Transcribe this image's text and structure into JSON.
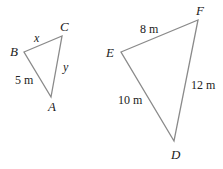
{
  "diagram": {
    "type": "similar-triangles",
    "triangles": [
      {
        "name": "triangle-ABC",
        "vertices": {
          "A": {
            "label": "A",
            "x": 51,
            "y": 97
          },
          "B": {
            "label": "B",
            "x": 24,
            "y": 52
          },
          "C": {
            "label": "C",
            "x": 62,
            "y": 36
          }
        },
        "sides": {
          "BC": {
            "label": "x"
          },
          "CA": {
            "label": "y"
          },
          "AB": {
            "label": "5 m"
          }
        }
      },
      {
        "name": "triangle-DEF",
        "vertices": {
          "D": {
            "label": "D",
            "x": 174,
            "y": 141
          },
          "E": {
            "label": "E",
            "x": 121,
            "y": 52
          },
          "F": {
            "label": "F",
            "x": 198,
            "y": 20
          }
        },
        "sides": {
          "EF": {
            "label": "8 m"
          },
          "FD": {
            "label": "12 m"
          },
          "DE": {
            "label": "10 m"
          }
        }
      }
    ],
    "colors": {
      "edge": "#8a8a8a",
      "text": "#222222",
      "background": "#ffffff"
    }
  }
}
